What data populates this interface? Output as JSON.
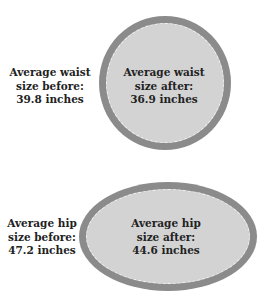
{
  "colors": {
    "ring": "#8b8b8b",
    "fill": "#d3d3d3",
    "dash": "#f4f4f4",
    "text": "#222222",
    "background": "#ffffff"
  },
  "waist": {
    "before": {
      "line1": "Average waist",
      "line2": "size before:",
      "line3": "39.8 inches",
      "value_inches": 39.8
    },
    "after": {
      "line1": "Average waist",
      "line2": "size after:",
      "line3": "36.9 inches",
      "value_inches": 36.9
    },
    "shape": "circle"
  },
  "hip": {
    "before": {
      "line1": "Average hip",
      "line2": "size before:",
      "line3": "47.2 inches",
      "value_inches": 47.2
    },
    "after": {
      "line1": "Average hip",
      "line2": "size after:",
      "line3": "44.6 inches",
      "value_inches": 44.6
    },
    "shape": "ellipse"
  }
}
